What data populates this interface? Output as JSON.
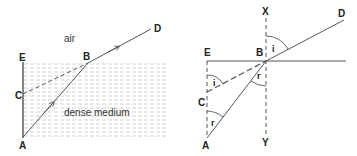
{
  "left_diagram": {
    "labels": {
      "E": "E",
      "B": "B",
      "C": "C",
      "A": "A",
      "D": "D"
    },
    "regions": {
      "upper": "air",
      "lower": "dense medium"
    }
  },
  "right_diagram": {
    "labels": {
      "X": "X",
      "Y": "Y",
      "E": "E",
      "B": "B",
      "C": "C",
      "A": "A",
      "D": "D"
    },
    "angles": {
      "incidence_top": "i",
      "refraction_normal": "r",
      "incidence_at_C": "i",
      "refraction_at_A": "r"
    }
  },
  "colors": {
    "line": "#555555",
    "hatch": "#bdbdbd",
    "text": "#222222"
  }
}
